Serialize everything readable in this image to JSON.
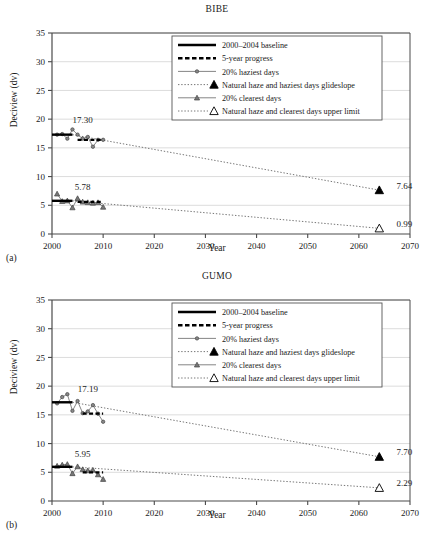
{
  "figure": {
    "axis_x_label": "Year",
    "axis_y_label": "Deciview (dv)",
    "xlim": [
      2000,
      2070
    ],
    "ylim": [
      0,
      35
    ],
    "xticks": [
      "2000",
      "2010",
      "2020",
      "2030",
      "2040",
      "2050",
      "2060",
      "2070"
    ],
    "yticks": [
      "0",
      "5",
      "10",
      "15",
      "20",
      "25",
      "30",
      "35"
    ]
  },
  "legend": {
    "items": [
      {
        "label": "2000–2004 baseline",
        "style": "solid-thick-black"
      },
      {
        "label": "5-year progress",
        "style": "dashed-thick-black"
      },
      {
        "label": "20% haziest days",
        "style": "line-circle-marker"
      },
      {
        "label": "Natural haze and haziest days glideslope",
        "style": "dotted-filled-triangle"
      },
      {
        "label": "20% clearest days",
        "style": "line-triangle-marker"
      },
      {
        "label": "Natural haze and clearest days upper limit",
        "style": "dotted-open-triangle"
      }
    ]
  },
  "panels": [
    {
      "tag": "(a)",
      "title": "BIBE",
      "haziest_label": "17.30",
      "clearest_label": "5.78",
      "glideslope_haziest_label": "7.64",
      "glideslope_clearest_label": "0.99",
      "chart_data": {
        "type": "line",
        "title": "BIBE",
        "xlabel": "Year",
        "ylabel": "Deciview (dv)",
        "xlim": [
          2000,
          2070
        ],
        "ylim": [
          0,
          35
        ],
        "grid": "horizontal",
        "legend_position": "top-right-inside",
        "annotations": [
          {
            "text": "17.30",
            "x": 2006,
            "y": 19.3
          },
          {
            "text": "5.78",
            "x": 2006,
            "y": 7.7
          },
          {
            "text": "7.64",
            "x": 2066,
            "y": 7.8
          },
          {
            "text": "0.99",
            "x": 2066,
            "y": 1.2
          }
        ],
        "series": [
          {
            "name": "20% haziest days",
            "x": [
              2001,
              2002,
              2003,
              2004,
              2005,
              2006,
              2007,
              2008,
              2009,
              2010
            ],
            "y": [
              17.3,
              17.4,
              16.6,
              18.2,
              17.3,
              16.6,
              16.9,
              15.2,
              16.4,
              16.4
            ]
          },
          {
            "name": "20% clearest days",
            "x": [
              2001,
              2002,
              2003,
              2004,
              2005,
              2006,
              2007,
              2008,
              2009,
              2010
            ],
            "y": [
              7.0,
              5.7,
              5.8,
              4.6,
              6.2,
              5.6,
              5.5,
              5.4,
              5.5,
              4.7
            ]
          },
          {
            "name": "2000–2004 baseline",
            "x": [
              2000,
              2004
            ],
            "y": [
              17.3,
              17.3
            ]
          },
          {
            "name": "5-year progress",
            "x": [
              2005,
              2010
            ],
            "y": [
              16.4,
              16.4
            ]
          },
          {
            "name": "2000–2004 baseline clearest",
            "x": [
              2000,
              2004
            ],
            "y": [
              5.78,
              5.78
            ]
          },
          {
            "name": "5-year progress clearest",
            "x": [
              2005,
              2010
            ],
            "y": [
              5.6,
              5.6
            ]
          },
          {
            "name": "Natural haze and haziest days glideslope",
            "x": [
              2004,
              2064
            ],
            "y": [
              17.3,
              7.64
            ]
          },
          {
            "name": "Natural haze and clearest days upper limit",
            "x": [
              2004,
              2064
            ],
            "y": [
              5.78,
              0.99
            ]
          }
        ]
      }
    },
    {
      "tag": "(b)",
      "title": "GUMO",
      "haziest_label": "17.19",
      "clearest_label": "5.95",
      "glideslope_haziest_label": "7.70",
      "glideslope_clearest_label": "2.29",
      "chart_data": {
        "type": "line",
        "title": "GUMO",
        "xlabel": "Year",
        "ylabel": "Deciview (dv)",
        "xlim": [
          2000,
          2070
        ],
        "ylim": [
          0,
          35
        ],
        "grid": "horizontal",
        "legend_position": "top-right-inside",
        "annotations": [
          {
            "text": "17.19",
            "x": 2007,
            "y": 19.0
          },
          {
            "text": "5.95",
            "x": 2006,
            "y": 7.6
          },
          {
            "text": "7.70",
            "x": 2066,
            "y": 8.0
          },
          {
            "text": "2.29",
            "x": 2066,
            "y": 2.6
          }
        ],
        "series": [
          {
            "name": "20% haziest days",
            "x": [
              2001,
              2002,
              2003,
              2004,
              2005,
              2006,
              2007,
              2008,
              2009,
              2010
            ],
            "y": [
              17.0,
              18.1,
              18.6,
              15.7,
              17.4,
              15.3,
              15.6,
              16.7,
              15.2,
              13.8
            ]
          },
          {
            "name": "20% clearest days",
            "x": [
              2001,
              2002,
              2003,
              2004,
              2005,
              2006,
              2007,
              2008,
              2009,
              2010
            ],
            "y": [
              6.1,
              6.3,
              6.4,
              4.8,
              6.0,
              5.5,
              5.3,
              5.4,
              4.6,
              3.8
            ]
          },
          {
            "name": "2000–2004 baseline",
            "x": [
              2000,
              2004
            ],
            "y": [
              17.19,
              17.19
            ]
          },
          {
            "name": "5-year progress",
            "x": [
              2006,
              2010
            ],
            "y": [
              15.2,
              15.2
            ]
          },
          {
            "name": "2000–2004 baseline clearest",
            "x": [
              2000,
              2004
            ],
            "y": [
              5.95,
              5.95
            ]
          },
          {
            "name": "5-year progress clearest",
            "x": [
              2006,
              2010
            ],
            "y": [
              5.0,
              5.0
            ]
          },
          {
            "name": "Natural haze and haziest days glideslope",
            "x": [
              2004,
              2064
            ],
            "y": [
              17.19,
              7.7
            ]
          },
          {
            "name": "Natural haze and clearest days upper limit",
            "x": [
              2004,
              2064
            ],
            "y": [
              5.95,
              2.29
            ]
          }
        ]
      }
    }
  ],
  "colors": {
    "axis": "#4a4a4a",
    "grid": "#cccccc",
    "data_line": "#777777",
    "marker": "#555555",
    "black": "#000000"
  }
}
